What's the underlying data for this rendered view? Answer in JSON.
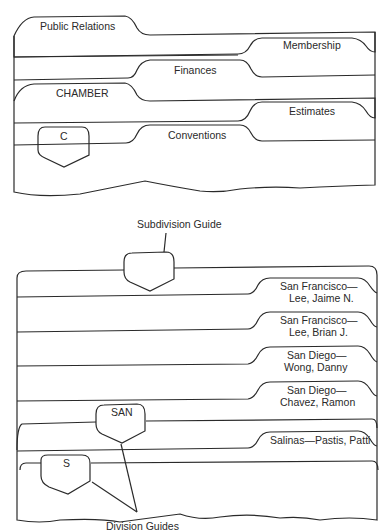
{
  "top_diagram": {
    "tabs": {
      "public_relations": "Public Relations",
      "membership": "Membership",
      "finances": "Finances",
      "chamber": "CHAMBER",
      "estimates": "Estimates",
      "conventions": "Conventions",
      "c_guide": "C"
    }
  },
  "bottom_diagram": {
    "annotation_top": "Subdivision Guide",
    "annotation_bottom": "Division Guides",
    "folders": [
      {
        "line1": "San Francisco—",
        "line2": "Lee, Jaime N."
      },
      {
        "line1": "San Francisco—",
        "line2": "Lee, Brian J."
      },
      {
        "line1": "San Diego—",
        "line2": "Wong, Danny"
      },
      {
        "line1": "San Diego—",
        "line2": "Chavez, Ramon"
      },
      {
        "line1": "Salinas—Pastis, Patti",
        "line2": ""
      }
    ],
    "guides": {
      "san": "SAN",
      "s": "S"
    }
  }
}
